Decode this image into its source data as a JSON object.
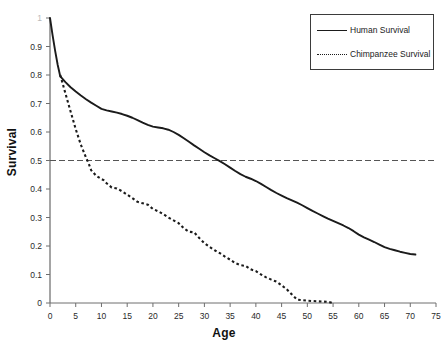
{
  "chart_data": {
    "type": "line",
    "title": "",
    "xlabel": "Age",
    "ylabel": "Survival",
    "xlim": [
      0,
      75
    ],
    "ylim": [
      0,
      1
    ],
    "grid": false,
    "legend_position": "top-right",
    "xticks": [
      0,
      5,
      10,
      15,
      20,
      25,
      30,
      35,
      40,
      45,
      50,
      55,
      60,
      65,
      70,
      75
    ],
    "xtick_labels": [
      "0",
      "5",
      "10",
      "15",
      "20",
      "25",
      "30",
      "35",
      "40",
      "45",
      "50",
      "55",
      "60",
      "65",
      "70",
      "75"
    ],
    "yticks": [
      0,
      0.1,
      0.2,
      0.3,
      0.4,
      0.5,
      0.6,
      0.7,
      0.8,
      0.9,
      1
    ],
    "ytick_labels": [
      "0",
      "0.1",
      "0.2",
      "0.3",
      "0.4",
      "0.5",
      "0.6",
      "0.7",
      "0.8",
      "0.9",
      "1"
    ],
    "annotations": [
      {
        "name": "median-survival-reference-line",
        "type": "hline",
        "y": 0.5,
        "style": "dashed",
        "color": "#555555"
      }
    ],
    "series": [
      {
        "name": "Human Survival",
        "style": "solid",
        "color": "#1b1b1b",
        "x": [
          0,
          0.5,
          1,
          1.5,
          2,
          3,
          4,
          5,
          6,
          7,
          8,
          9,
          10,
          11,
          12,
          13,
          14,
          15,
          16,
          17,
          18,
          19,
          20,
          21,
          22,
          23,
          24,
          25,
          26,
          27,
          28,
          29,
          30,
          31,
          32,
          33,
          34,
          35,
          36,
          37,
          38,
          39,
          40,
          41,
          42,
          43,
          44,
          45,
          46,
          47,
          48,
          49,
          50,
          51,
          52,
          53,
          54,
          55,
          56,
          57,
          58,
          59,
          60,
          61,
          62,
          63,
          64,
          65,
          66,
          67,
          68,
          69,
          70,
          71
        ],
        "y": [
          1.0,
          0.94,
          0.885,
          0.835,
          0.795,
          0.775,
          0.757,
          0.742,
          0.728,
          0.715,
          0.703,
          0.692,
          0.681,
          0.676,
          0.672,
          0.668,
          0.663,
          0.657,
          0.65,
          0.642,
          0.633,
          0.625,
          0.619,
          0.616,
          0.613,
          0.608,
          0.6,
          0.59,
          0.578,
          0.566,
          0.553,
          0.541,
          0.529,
          0.518,
          0.508,
          0.498,
          0.487,
          0.475,
          0.463,
          0.452,
          0.443,
          0.436,
          0.428,
          0.418,
          0.407,
          0.396,
          0.386,
          0.377,
          0.368,
          0.36,
          0.352,
          0.343,
          0.333,
          0.323,
          0.314,
          0.305,
          0.296,
          0.288,
          0.28,
          0.272,
          0.263,
          0.252,
          0.24,
          0.23,
          0.222,
          0.214,
          0.205,
          0.196,
          0.19,
          0.185,
          0.18,
          0.176,
          0.172,
          0.17
        ]
      },
      {
        "name": "Chimpanzee Survival",
        "style": "dotted",
        "color": "#1b1b1b",
        "x": [
          2,
          3,
          4,
          5,
          6,
          7,
          7.5,
          8,
          9,
          10,
          10.5,
          11,
          12,
          13,
          14,
          15,
          16,
          17,
          18,
          19,
          20,
          21,
          22,
          23,
          24,
          25,
          26,
          27,
          28,
          29,
          30,
          31,
          32,
          33,
          34,
          35,
          36,
          37,
          38,
          39,
          40,
          41,
          42,
          43,
          44,
          45,
          46,
          47,
          48,
          50,
          52,
          54,
          55
        ],
        "y": [
          0.8,
          0.735,
          0.672,
          0.61,
          0.555,
          0.51,
          0.49,
          0.466,
          0.446,
          0.435,
          0.43,
          0.42,
          0.405,
          0.402,
          0.392,
          0.38,
          0.368,
          0.355,
          0.35,
          0.345,
          0.33,
          0.322,
          0.312,
          0.3,
          0.29,
          0.28,
          0.262,
          0.25,
          0.248,
          0.228,
          0.21,
          0.197,
          0.185,
          0.175,
          0.163,
          0.152,
          0.14,
          0.133,
          0.13,
          0.118,
          0.112,
          0.1,
          0.09,
          0.082,
          0.075,
          0.062,
          0.048,
          0.03,
          0.012,
          0.008,
          0.006,
          0.004,
          0.0
        ]
      }
    ]
  },
  "legend": {
    "items": [
      {
        "label": "Human Survival"
      },
      {
        "label": "Chimpanzee Survival"
      }
    ]
  }
}
